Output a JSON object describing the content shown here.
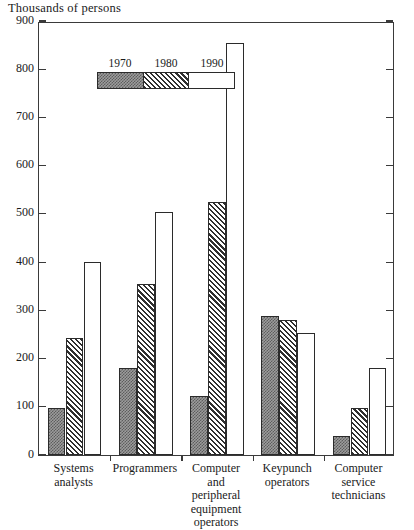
{
  "chart_data": {
    "type": "bar",
    "title": "Thousands of persons",
    "xlabel": "",
    "ylabel": "Thousands of persons",
    "ylim": [
      0,
      900
    ],
    "yticks": [
      0,
      100,
      200,
      300,
      400,
      500,
      600,
      700,
      800,
      900
    ],
    "grid": false,
    "legend_position": "top-left",
    "categories": [
      "Systems\nanalysts",
      "Programmers",
      "Computer\nand\nperipheral\nequipment\noperators",
      "Keypunch\noperators",
      "Computer\nservice\ntechnicians"
    ],
    "series": [
      {
        "name": "1970",
        "pattern": "stipple-gray",
        "values": [
          97,
          180,
          123,
          288,
          40
        ]
      },
      {
        "name": "1980",
        "pattern": "diagonal-hatch",
        "values": [
          243,
          355,
          525,
          281,
          97
        ]
      },
      {
        "name": "1990",
        "pattern": "white",
        "values": [
          400,
          503,
          855,
          252,
          180
        ]
      }
    ]
  },
  "legend": {
    "entries": [
      {
        "label": "1970"
      },
      {
        "label": "1980"
      },
      {
        "label": "1990"
      }
    ]
  },
  "colors": {
    "axis": "#3a3a3a",
    "bar_outline": "#2b2b2b",
    "series_1970": "#9c9c9c",
    "series_1980": "#2f2f2f",
    "series_1990": "#ffffff",
    "background": "#ffffff"
  }
}
